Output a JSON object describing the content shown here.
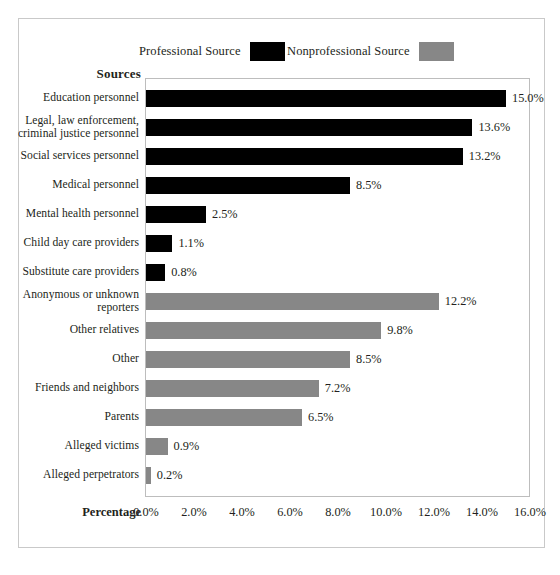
{
  "chart_data": {
    "type": "bar",
    "orientation": "horizontal",
    "title": "",
    "xlabel": "Percentage",
    "ylabel": "Sources",
    "xlim": [
      0,
      16
    ],
    "xticks": [
      "0.0%",
      "2.0%",
      "4.0%",
      "6.0%",
      "8.0%",
      "10.0%",
      "12.0%",
      "14.0%",
      "16.0%"
    ],
    "xtick_values": [
      0,
      2,
      4,
      6,
      8,
      10,
      12,
      14,
      16
    ],
    "grid": false,
    "legend_position": "top",
    "legend": [
      {
        "name": "Professional Source",
        "color": "#000000"
      },
      {
        "name": "Nonprofessional Source",
        "color": "#878787"
      }
    ],
    "categories": [
      "Education personnel",
      "Legal, law enforcement, criminal justice personnel",
      "Social services personnel",
      "Medical personnel",
      "Mental health personnel",
      "Child day care providers",
      "Substitute care providers",
      "Anonymous or unknown reporters",
      "Other relatives",
      "Other",
      "Friends and neighbors",
      "Parents",
      "Alleged victims",
      "Alleged perpetrators"
    ],
    "values": [
      15.0,
      13.6,
      13.2,
      8.5,
      2.5,
      1.1,
      0.8,
      12.2,
      9.8,
      8.5,
      7.2,
      6.5,
      0.9,
      0.2
    ],
    "labels": [
      "15.0%",
      "13.6%",
      "13.2%",
      "8.5%",
      "2.5%",
      "1.1%",
      "0.8%",
      "12.2%",
      "9.8%",
      "8.5%",
      "7.2%",
      "6.5%",
      "0.9%",
      "0.2%"
    ],
    "series_of_point": [
      "professional",
      "professional",
      "professional",
      "professional",
      "professional",
      "professional",
      "professional",
      "nonprofessional",
      "nonprofessional",
      "nonprofessional",
      "nonprofessional",
      "nonprofessional",
      "nonprofessional",
      "nonprofessional"
    ]
  },
  "legend": {
    "professional": {
      "label": "Professional Source",
      "color": "#000000"
    },
    "nonprofessional": {
      "label": "Nonprofessional Source",
      "color": "#878787"
    }
  },
  "axes": {
    "y_title": "Sources",
    "x_title": "Percentage"
  },
  "rows": [
    {
      "label_lines": [
        "Education personnel"
      ],
      "value": 15.0,
      "value_label": "15.0%",
      "series": "professional"
    },
    {
      "label_lines": [
        "Legal, law enforcement,",
        "criminal justice personnel"
      ],
      "value": 13.6,
      "value_label": "13.6%",
      "series": "professional"
    },
    {
      "label_lines": [
        "Social services personnel"
      ],
      "value": 13.2,
      "value_label": "13.2%",
      "series": "professional"
    },
    {
      "label_lines": [
        "Medical personnel"
      ],
      "value": 8.5,
      "value_label": "8.5%",
      "series": "professional"
    },
    {
      "label_lines": [
        "Mental health personnel"
      ],
      "value": 2.5,
      "value_label": "2.5%",
      "series": "professional"
    },
    {
      "label_lines": [
        "Child day care providers"
      ],
      "value": 1.1,
      "value_label": "1.1%",
      "series": "professional"
    },
    {
      "label_lines": [
        "Substitute care providers"
      ],
      "value": 0.8,
      "value_label": "0.8%",
      "series": "professional"
    },
    {
      "label_lines": [
        "Anonymous or unknown",
        "reporters"
      ],
      "value": 12.2,
      "value_label": "12.2%",
      "series": "nonprofessional"
    },
    {
      "label_lines": [
        "Other relatives"
      ],
      "value": 9.8,
      "value_label": "9.8%",
      "series": "nonprofessional"
    },
    {
      "label_lines": [
        "Other"
      ],
      "value": 8.5,
      "value_label": "8.5%",
      "series": "nonprofessional"
    },
    {
      "label_lines": [
        "Friends and neighbors"
      ],
      "value": 7.2,
      "value_label": "7.2%",
      "series": "nonprofessional"
    },
    {
      "label_lines": [
        "Parents"
      ],
      "value": 6.5,
      "value_label": "6.5%",
      "series": "nonprofessional"
    },
    {
      "label_lines": [
        "Alleged victims"
      ],
      "value": 0.9,
      "value_label": "0.9%",
      "series": "nonprofessional"
    },
    {
      "label_lines": [
        "Alleged perpetrators"
      ],
      "value": 0.2,
      "value_label": "0.2%",
      "series": "nonprofessional"
    }
  ]
}
